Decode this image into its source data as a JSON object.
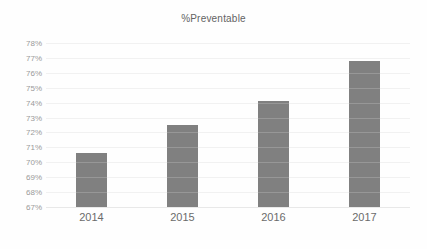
{
  "chart_data": {
    "type": "bar",
    "title": "%Preventable",
    "xlabel": "",
    "ylabel": "",
    "categories": [
      "2014",
      "2015",
      "2016",
      "2017"
    ],
    "values": [
      70.6,
      72.5,
      74.1,
      76.8
    ],
    "value_suffix": "%",
    "ylim": [
      67,
      78
    ],
    "ytick_step": 1,
    "ytick_labels": [
      "78%",
      "77%",
      "76%",
      "75%",
      "74%",
      "73%",
      "72%",
      "71%",
      "70%",
      "69%",
      "68%",
      "67%"
    ],
    "ytick_values": [
      78,
      77,
      76,
      75,
      74,
      73,
      72,
      71,
      70,
      69,
      68,
      67
    ],
    "grid": "horizontal",
    "legend": "none",
    "series": [
      {
        "name": "%Preventable",
        "color": "#808080",
        "values": [
          70.6,
          72.5,
          74.1,
          76.8
        ]
      }
    ]
  },
  "colors": {
    "bar": "#808080",
    "gridline": "#f1f1f1",
    "baseline": "#e8e8e8",
    "title_text": "#636363",
    "ytick_text": "#9a9a9a",
    "xtick_text": "#6b6b6b",
    "background": "#fefefe"
  }
}
